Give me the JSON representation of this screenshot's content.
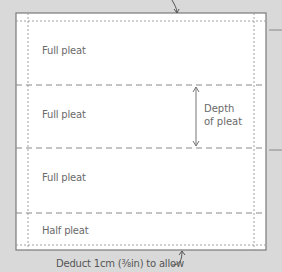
{
  "diagram": {
    "sections": [
      {
        "label": "Full pleat"
      },
      {
        "label": "Full pleat"
      },
      {
        "label": "Full pleat"
      },
      {
        "label": "Half pleat"
      }
    ],
    "depth_label_line1": "Depth",
    "depth_label_line2": "of pleat",
    "bottom_caption": "Deduct 1cm (⅜in) to allow",
    "colors": {
      "background": "#d9d9d9",
      "panel": "#ffffff",
      "border": "#7a7a7a",
      "line": "#8a8a8a"
    }
  }
}
